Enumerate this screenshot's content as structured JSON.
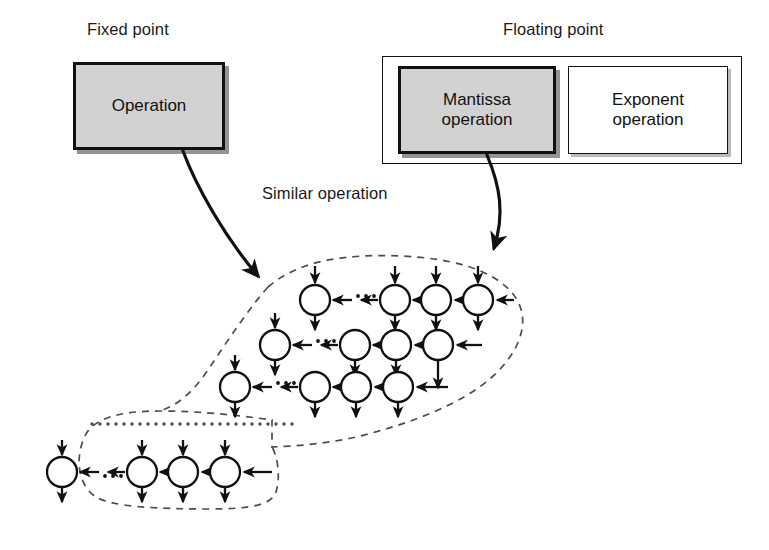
{
  "figure": {
    "kind": "systolic-array-architecture-diagram",
    "background_color": "#ffffff",
    "line_color": "#111111",
    "shaded_fill": "#d2d2d2",
    "dashed_boundary_color": "#4d4d4d"
  },
  "titles": {
    "fixed_point": "Fixed point",
    "floating_point": "Floating point"
  },
  "boxes": {
    "operation": "Operation",
    "mantissa_operation": "Mantissa\noperation",
    "mantissa_line1": "Mantissa",
    "mantissa_line2": "operation",
    "exponent_line1": "Exponent",
    "exponent_line2": "operation"
  },
  "annotations": {
    "similar_operation": "Similar operation"
  },
  "array": {
    "description": "Triangular systolic processor array enclosed by a dashed boundary",
    "node_radius": 15,
    "rows": [
      {
        "row_index": 0,
        "y": 300,
        "nodes_x": [
          315,
          395,
          436,
          478
        ],
        "ellipsis_between": [
          0,
          1
        ],
        "right_input_arrow": true
      },
      {
        "row_index": 1,
        "y": 345,
        "nodes_x": [
          275,
          355,
          396,
          438
        ],
        "ellipsis_between": [
          0,
          1
        ],
        "right_input_arrow": true
      },
      {
        "row_index": 2,
        "y": 387,
        "nodes_x": [
          235,
          315,
          356,
          398
        ],
        "ellipsis_between": [
          0,
          1
        ],
        "right_input_arrow": true
      },
      {
        "row_index": 3,
        "y": 472,
        "nodes_x": [
          62,
          142,
          183,
          225
        ],
        "ellipsis_between": [
          0,
          1
        ],
        "right_input_arrow": true
      }
    ],
    "vertical_ellipsis_row": {
      "y": 424,
      "x_start": 92,
      "x_end": 298
    }
  },
  "connectors": [
    {
      "name": "operation-to-array",
      "from": "operation box bottom",
      "to": "array dashed boundary upper-left",
      "style": "curved solid arrow"
    },
    {
      "name": "mantissa-to-array",
      "from": "mantissa operation box bottom",
      "to": "array dashed boundary upper-right",
      "style": "curved solid arrow"
    }
  ]
}
